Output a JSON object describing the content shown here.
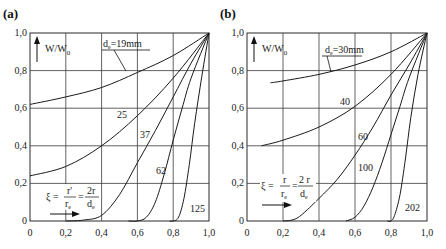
{
  "chart_data": [
    {
      "panel": "(a)",
      "type": "line",
      "title": "(a)",
      "ylabel": "W/W0",
      "xlabel": "ξ = r'/r_e = 2r/d_e",
      "xlim": [
        0,
        1.0
      ],
      "ylim": [
        0,
        1.0
      ],
      "x_ticks": [
        "0",
        "0,2",
        "0,4",
        "0,6",
        "0,8",
        "1,0"
      ],
      "y_ticks": [
        "0",
        "0,2",
        "0,4",
        "0,6",
        "0,8",
        "1,0"
      ],
      "grid": true,
      "series": [
        {
          "name": "de=19mm",
          "label": "de=19mm",
          "x": [
            0,
            0.2,
            0.4,
            0.6,
            0.8,
            1.0
          ],
          "y": [
            0.62,
            0.66,
            0.71,
            0.79,
            0.88,
            1.0
          ]
        },
        {
          "name": "25",
          "label": "25",
          "x": [
            0,
            0.2,
            0.4,
            0.6,
            0.8,
            1.0
          ],
          "y": [
            0.24,
            0.29,
            0.4,
            0.56,
            0.76,
            1.0
          ]
        },
        {
          "name": "37",
          "label": "37",
          "x": [
            0.2,
            0.3,
            0.4,
            0.5,
            0.6,
            0.7,
            0.8,
            0.9,
            1.0
          ],
          "y": [
            0.0,
            0.005,
            0.03,
            0.14,
            0.31,
            0.48,
            0.66,
            0.84,
            1.0
          ]
        },
        {
          "name": "62",
          "label": "62",
          "x": [
            0.55,
            0.6,
            0.65,
            0.7,
            0.75,
            0.8,
            0.85,
            0.9,
            1.0
          ],
          "y": [
            0.0,
            0.0,
            0.02,
            0.1,
            0.25,
            0.43,
            0.6,
            0.76,
            1.0
          ]
        },
        {
          "name": "125",
          "label": "125",
          "x": [
            0.78,
            0.8,
            0.83,
            0.86,
            0.89,
            0.92,
            0.96,
            1.0
          ],
          "y": [
            0.0,
            0.0,
            0.02,
            0.12,
            0.3,
            0.52,
            0.77,
            1.0
          ]
        }
      ]
    },
    {
      "panel": "(b)",
      "type": "line",
      "title": "(b)",
      "ylabel": "W/W0",
      "xlabel": "ξ = r/r_e = 2r/d_e",
      "xlim": [
        0,
        1.0
      ],
      "ylim": [
        0,
        1.0
      ],
      "x_ticks": [
        "0",
        "0,2",
        "0,4",
        "0,6",
        "0,8",
        "1,0"
      ],
      "y_ticks": [
        "0",
        "0,2",
        "0,4",
        "0,6",
        "0,8",
        "1,0"
      ],
      "grid": true,
      "series": [
        {
          "name": "de=30mm",
          "label": "de=30mm",
          "x": [
            0.13,
            0.2,
            0.4,
            0.6,
            0.8,
            1.0
          ],
          "y": [
            0.735,
            0.745,
            0.78,
            0.83,
            0.9,
            1.0
          ]
        },
        {
          "name": "40",
          "label": "40",
          "x": [
            0.08,
            0.2,
            0.4,
            0.6,
            0.8,
            1.0
          ],
          "y": [
            0.4,
            0.43,
            0.5,
            0.61,
            0.78,
            1.0
          ]
        },
        {
          "name": "60",
          "label": "60",
          "x": [
            0.2,
            0.25,
            0.3,
            0.4,
            0.5,
            0.6,
            0.7,
            0.8,
            0.9,
            1.0
          ],
          "y": [
            0.0,
            0.005,
            0.03,
            0.12,
            0.22,
            0.35,
            0.5,
            0.67,
            0.83,
            1.0
          ]
        },
        {
          "name": "100",
          "label": "100",
          "x": [
            0.55,
            0.6,
            0.65,
            0.7,
            0.75,
            0.8,
            0.85,
            0.9,
            1.0
          ],
          "y": [
            0.0,
            0.02,
            0.08,
            0.18,
            0.31,
            0.46,
            0.61,
            0.76,
            1.0
          ]
        },
        {
          "name": "202",
          "label": "202",
          "x": [
            0.78,
            0.8,
            0.82,
            0.85,
            0.88,
            0.91,
            0.95,
            1.0
          ],
          "y": [
            0.0,
            0.0,
            0.03,
            0.14,
            0.33,
            0.55,
            0.78,
            1.0
          ]
        }
      ]
    }
  ],
  "panels": {
    "a": {
      "title": "(a)",
      "ylabel": "W/W",
      "ylabel_sub": "0",
      "curve_labels": {
        "c19": "d",
        "c19_sub": "e",
        "c19_rest": "=19mm",
        "c25": "25",
        "c37": "37",
        "c62": "62",
        "c125": "125"
      },
      "formula": {
        "xi": "ξ =",
        "num1": "r'",
        "den1": "r",
        "den1_sub": "e",
        "eq": "=",
        "num2": "2r",
        "den2": "d",
        "den2_sub": "e"
      }
    },
    "b": {
      "title": "(b)",
      "ylabel": "W/W",
      "ylabel_sub": "0",
      "curve_labels": {
        "c30": "d",
        "c30_sub": "e",
        "c30_rest": "=30mm",
        "c40": "40",
        "c60": "60",
        "c100": "100",
        "c202": "202"
      },
      "formula": {
        "xi": "ξ =",
        "num1": "r",
        "den1": "r",
        "den1_sub": "e",
        "eq": "=",
        "num2": "2 r",
        "den2": "d",
        "den2_sub": "e"
      }
    },
    "x_ticks": [
      "0",
      "0,2",
      "0,4",
      "0,6",
      "0,8",
      "1,0"
    ],
    "y_ticks": [
      "0",
      "0,2",
      "0,4",
      "0,6",
      "0,8",
      "1,0"
    ]
  }
}
